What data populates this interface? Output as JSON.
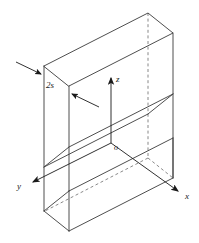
{
  "figure": {
    "background_color": "#ffffff",
    "line_color": "#3a3a3a",
    "text_color": "#1a1a1a"
  },
  "labels": {
    "axis_x": "x",
    "axis_y": "y",
    "axis_z": "z",
    "origin": "o",
    "thickness": "2s",
    "thickness_number": "2",
    "thickness_symbol": "s"
  },
  "geometry": {
    "projection": "isometric",
    "visible_edge_style": "solid",
    "hidden_edge_style": "dashed",
    "solid": "rectangular slab",
    "vertices": {
      "top_back": [
        148,
        13
      ],
      "top_right": [
        173,
        33
      ],
      "top_left": [
        44,
        66
      ],
      "top_front": [
        69,
        86
      ],
      "mid_right": [
        173,
        134
      ],
      "mid_front_right": [
        148,
        114
      ],
      "mid_left": [
        44,
        167
      ],
      "mid_front_left": [
        69,
        147
      ],
      "bot_left": [
        44,
        211
      ],
      "bot_front_left": [
        69,
        191
      ],
      "bot_right": [
        173,
        178
      ],
      "bot_front_right": [
        148,
        158
      ]
    }
  },
  "annotations": {
    "dimension_arrows": 2,
    "arrow_upper": {
      "from": [
        17,
        63
      ],
      "to": [
        44,
        76
      ]
    },
    "arrow_lower": {
      "from": [
        97,
        105
      ],
      "to": [
        70,
        93
      ]
    }
  },
  "axes": {
    "z": {
      "from": [
        111,
        143
      ],
      "to": [
        111,
        74
      ],
      "label_pos": [
        116,
        79
      ],
      "direction": "up"
    },
    "x": {
      "from": [
        111,
        143
      ],
      "to": [
        180,
        193
      ],
      "label_pos": [
        186,
        197
      ],
      "direction": "down-right"
    },
    "y": {
      "from": [
        111,
        143
      ],
      "to": [
        30,
        184
      ],
      "label_pos": [
        19,
        187
      ],
      "direction": "down-left"
    },
    "origin_pos": [
      114,
      148
    ]
  }
}
